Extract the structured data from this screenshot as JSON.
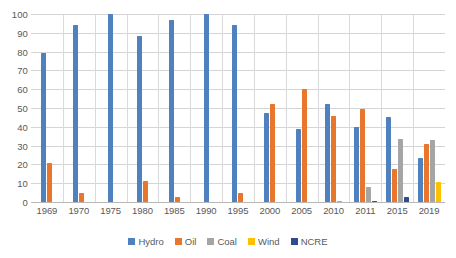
{
  "chart_data": {
    "type": "bar",
    "title": "",
    "xlabel": "",
    "ylabel": "",
    "ylim": [
      0,
      100
    ],
    "yticks": [
      100,
      90,
      80,
      70,
      60,
      50,
      40,
      30,
      20,
      10,
      0
    ],
    "grid": true,
    "legend_position": "bottom",
    "categories": [
      "1969",
      "1970",
      "1975",
      "1980",
      "1985",
      "1990",
      "1995",
      "2000",
      "2005",
      "2010",
      "2011",
      "2015",
      "2019"
    ],
    "series": [
      {
        "name": "Hydro",
        "color": "#4e81bd",
        "values": [
          79,
          94,
          100,
          88.5,
          97,
          100,
          94,
          47.5,
          39,
          52,
          40,
          45,
          23.5
        ]
      },
      {
        "name": "Oil",
        "color": "#e8762c",
        "values": [
          20.5,
          5,
          0,
          11,
          2.5,
          0,
          5,
          52,
          60,
          46,
          49.5,
          17.5,
          31
        ]
      },
      {
        "name": "Coal",
        "color": "#a5a5a5",
        "values": [
          0,
          0,
          0,
          0,
          0,
          0,
          0,
          0,
          0,
          0.6,
          8,
          33.5,
          33
        ]
      },
      {
        "name": "Wind",
        "color": "#ffc000",
        "values": [
          0,
          0,
          0,
          0,
          0,
          0,
          0,
          0,
          0,
          0,
          0,
          0,
          10.5
        ]
      },
      {
        "name": "NCRE",
        "color": "#2e4c8e",
        "values": [
          0,
          0,
          0,
          0,
          0,
          0,
          0,
          0,
          0,
          0,
          0.7,
          2.5,
          0
        ]
      }
    ]
  }
}
